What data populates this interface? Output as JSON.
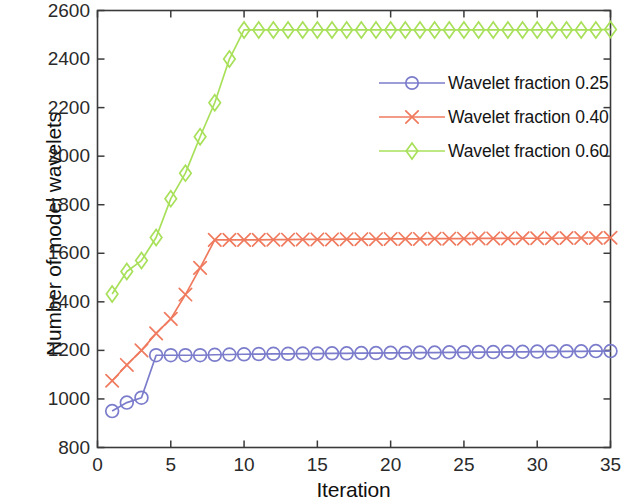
{
  "chart_data": {
    "type": "line",
    "title": "",
    "xlabel": "Iteration",
    "ylabel": "Number of model wavelets",
    "xlim": [
      0,
      35
    ],
    "ylim": [
      800,
      2600
    ],
    "xticks": [
      0,
      5,
      10,
      15,
      20,
      25,
      30,
      35
    ],
    "yticks": [
      800,
      1000,
      1200,
      1400,
      1600,
      1800,
      2000,
      2200,
      2400,
      2600
    ],
    "grid": false,
    "legend_position": "upper right",
    "x": [
      1,
      2,
      3,
      4,
      5,
      6,
      7,
      8,
      9,
      10,
      11,
      12,
      13,
      14,
      15,
      16,
      17,
      18,
      19,
      20,
      21,
      22,
      23,
      24,
      25,
      26,
      27,
      28,
      29,
      30,
      31,
      32,
      33,
      34,
      35
    ],
    "series": [
      {
        "name": "Wavelet fraction 0.25",
        "color": "#7b7ccb",
        "marker": "circle",
        "values": [
          950,
          985,
          1005,
          1180,
          1180,
          1180,
          1180,
          1182,
          1183,
          1184,
          1185,
          1186,
          1186,
          1187,
          1187,
          1188,
          1188,
          1189,
          1189,
          1190,
          1190,
          1191,
          1191,
          1192,
          1192,
          1193,
          1193,
          1194,
          1194,
          1195,
          1195,
          1196,
          1196,
          1197,
          1197
        ]
      },
      {
        "name": "Wavelet fraction 0.40",
        "color": "#ef7a5e",
        "marker": "x",
        "values": [
          1075,
          1140,
          1200,
          1270,
          1330,
          1430,
          1540,
          1655,
          1655,
          1655,
          1655,
          1656,
          1656,
          1657,
          1657,
          1657,
          1658,
          1658,
          1658,
          1659,
          1659,
          1659,
          1660,
          1660,
          1660,
          1661,
          1661,
          1661,
          1662,
          1662,
          1662,
          1663,
          1663,
          1663,
          1664
        ]
      },
      {
        "name": "Wavelet fraction 0.60",
        "color": "#a8e05a",
        "marker": "diamond",
        "values": [
          1432,
          1525,
          1570,
          1665,
          1825,
          1930,
          2080,
          2220,
          2400,
          2520,
          2520,
          2520,
          2520,
          2520,
          2520,
          2520,
          2520,
          2520,
          2520,
          2520,
          2520,
          2520,
          2520,
          2520,
          2520,
          2520,
          2520,
          2520,
          2520,
          2520,
          2520,
          2520,
          2520,
          2520,
          2522
        ]
      }
    ]
  },
  "legend": {
    "items": [
      {
        "label": "Wavelet fraction 0.25"
      },
      {
        "label": "Wavelet fraction 0.40"
      },
      {
        "label": "Wavelet fraction 0.60"
      }
    ]
  },
  "axes": {
    "x_title": "Iteration",
    "y_title": "Number of model wavelets",
    "x_tick_labels": [
      "0",
      "5",
      "10",
      "15",
      "20",
      "25",
      "30",
      "35"
    ],
    "y_tick_labels": [
      "800",
      "1000",
      "1200",
      "1400",
      "1600",
      "1800",
      "2000",
      "2200",
      "2400",
      "2600"
    ],
    "axis_color": "#3a3a3a"
  }
}
